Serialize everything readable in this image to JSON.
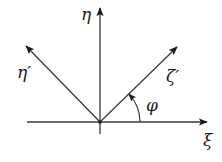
{
  "diagram": {
    "type": "coordinate-rotation",
    "colors": {
      "stroke": "#3a3a3a",
      "text": "#1a1a1a",
      "background": "#ffffff"
    },
    "origin": {
      "x": 100,
      "y": 122
    },
    "axes": {
      "xi": {
        "label": "ξ",
        "from": [
          27,
          122
        ],
        "to": [
          207,
          122
        ]
      },
      "eta": {
        "label": "η",
        "from": [
          100,
          134
        ],
        "to": [
          100,
          8
        ]
      },
      "xi_p": {
        "label": "ζ′",
        "from": [
          100,
          122
        ],
        "to": [
          177,
          47
        ]
      },
      "eta_p": {
        "label": "η′",
        "from": [
          100,
          122
        ],
        "to": [
          26,
          46
        ]
      }
    },
    "angle": {
      "label": "φ",
      "radius": 40,
      "start_deg": 0,
      "end_deg": 44
    }
  }
}
